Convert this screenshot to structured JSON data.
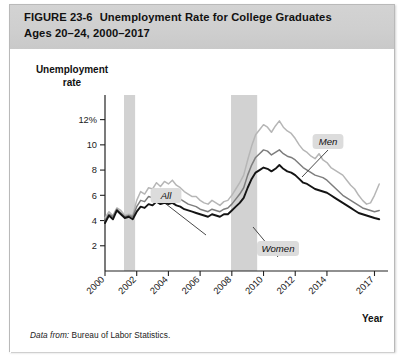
{
  "figure": {
    "label": "FIGURE",
    "number": "23-6",
    "title_line1": "Unemployment Rate for College Graduates",
    "title_line2": "Ages 20–24, 2000–2017",
    "source_prefix": "Data from:",
    "source_text": "Bureau of Labor Statistics."
  },
  "chart_data": {
    "type": "line",
    "title": "Unemployment Rate for College Graduates Ages 20–24, 2000–2017",
    "xlabel": "Year",
    "ylabel": "Unemployment rate",
    "ylim": [
      0,
      13
    ],
    "xlim": [
      2000,
      2017.6
    ],
    "grid": false,
    "legend": "inline-callouts",
    "ytick_labels": [
      "2",
      "4",
      "6",
      "8",
      "10",
      "12%"
    ],
    "ytick_values": [
      2,
      4,
      6,
      8,
      10,
      12
    ],
    "xtick_labels": [
      "2000",
      "2002",
      "2004",
      "2006",
      "2008",
      "2010",
      "2012",
      "2014",
      "2017"
    ],
    "xtick_values": [
      2000,
      2002,
      2004,
      2006,
      2008,
      2010,
      2012,
      2014,
      2017
    ],
    "annotations": [
      {
        "label": "All",
        "x": 2004.6,
        "y": 9.3
      },
      {
        "label": "Men",
        "x": 2012.1,
        "y": 12.6
      },
      {
        "label": "Women",
        "x": 2010.3,
        "y": 6.0
      }
    ],
    "shaded_bands": [
      {
        "name": "recession-2001",
        "x0": 2001.2,
        "x1": 2001.9,
        "color": "#d2d2d2"
      },
      {
        "name": "recession-2008",
        "x0": 2007.95,
        "x1": 2009.6,
        "color": "#d2d2d2"
      }
    ],
    "colors": {
      "all": "#7d7d7d",
      "men": "#b6b6b6",
      "women": "#141414"
    },
    "x": [
      2000.0,
      2000.25,
      2000.5,
      2000.75,
      2001.0,
      2001.25,
      2001.5,
      2001.75,
      2002.0,
      2002.25,
      2002.5,
      2002.75,
      2003.0,
      2003.25,
      2003.5,
      2003.75,
      2004.0,
      2004.25,
      2004.5,
      2004.75,
      2005.0,
      2005.25,
      2005.5,
      2005.75,
      2006.0,
      2006.25,
      2006.5,
      2006.75,
      2007.0,
      2007.25,
      2007.5,
      2007.75,
      2008.0,
      2008.25,
      2008.5,
      2008.75,
      2009.0,
      2009.25,
      2009.5,
      2009.75,
      2010.0,
      2010.25,
      2010.5,
      2010.75,
      2011.0,
      2011.25,
      2011.5,
      2011.75,
      2012.0,
      2012.25,
      2012.5,
      2012.75,
      2013.0,
      2013.25,
      2013.5,
      2013.75,
      2014.0,
      2014.25,
      2014.5,
      2014.75,
      2015.0,
      2015.25,
      2015.5,
      2015.75,
      2016.0,
      2016.25,
      2016.5,
      2016.75,
      2017.0,
      2017.3
    ],
    "series": [
      {
        "name": "All",
        "color": "#7d7d7d",
        "values": [
          4.0,
          4.5,
          4.3,
          4.9,
          4.6,
          4.3,
          4.4,
          4.3,
          5.1,
          5.6,
          5.5,
          5.9,
          5.8,
          6.2,
          5.9,
          6.1,
          6.0,
          6.2,
          5.9,
          5.7,
          5.5,
          5.3,
          5.2,
          5.1,
          4.9,
          4.8,
          4.7,
          4.9,
          4.8,
          4.7,
          4.9,
          5.0,
          5.3,
          5.7,
          6.1,
          6.6,
          7.6,
          8.4,
          9.0,
          9.3,
          9.6,
          9.5,
          9.2,
          9.4,
          9.6,
          9.3,
          9.1,
          9.0,
          8.8,
          8.5,
          8.2,
          8.0,
          7.8,
          7.6,
          7.5,
          7.4,
          7.2,
          6.9,
          6.6,
          6.3,
          6.0,
          5.8,
          5.6,
          5.4,
          5.2,
          5.0,
          4.9,
          4.8,
          4.7,
          4.8
        ]
      },
      {
        "name": "Men",
        "color": "#b6b6b6",
        "values": [
          4.2,
          4.7,
          4.4,
          5.0,
          4.8,
          4.4,
          4.5,
          4.4,
          5.6,
          6.3,
          6.1,
          6.6,
          6.5,
          7.0,
          6.7,
          7.1,
          6.9,
          7.2,
          6.8,
          6.6,
          6.3,
          6.1,
          5.9,
          5.9,
          5.6,
          5.4,
          5.3,
          5.6,
          5.4,
          5.2,
          5.5,
          5.6,
          6.0,
          6.5,
          7.0,
          7.6,
          8.8,
          9.9,
          10.8,
          11.2,
          11.6,
          11.4,
          11.0,
          11.5,
          11.9,
          11.4,
          11.1,
          10.9,
          10.5,
          10.0,
          9.6,
          9.4,
          9.1,
          8.9,
          9.3,
          8.8,
          8.6,
          8.2,
          8.0,
          7.8,
          7.6,
          7.2,
          6.8,
          6.5,
          6.0,
          5.6,
          5.3,
          5.4,
          6.0,
          6.9
        ]
      },
      {
        "name": "Women",
        "color": "#141414",
        "values": [
          3.8,
          4.4,
          4.1,
          4.8,
          4.5,
          4.2,
          4.3,
          4.1,
          4.7,
          5.1,
          5.0,
          5.3,
          5.2,
          5.5,
          5.3,
          5.4,
          5.3,
          5.4,
          5.2,
          5.1,
          4.9,
          4.8,
          4.7,
          4.6,
          4.5,
          4.4,
          4.3,
          4.5,
          4.4,
          4.3,
          4.5,
          4.5,
          4.8,
          5.1,
          5.4,
          5.8,
          6.6,
          7.3,
          7.8,
          8.0,
          8.2,
          8.1,
          7.9,
          8.1,
          8.4,
          8.1,
          7.9,
          7.8,
          7.6,
          7.3,
          7.0,
          6.9,
          6.7,
          6.5,
          6.4,
          6.3,
          6.2,
          6.0,
          5.8,
          5.6,
          5.4,
          5.2,
          5.0,
          4.8,
          4.6,
          4.5,
          4.4,
          4.3,
          4.2,
          4.1
        ]
      }
    ]
  }
}
